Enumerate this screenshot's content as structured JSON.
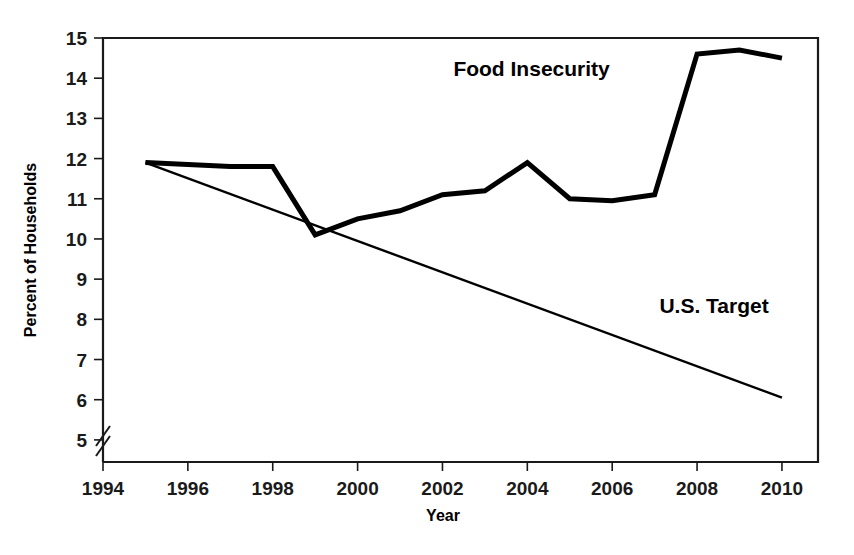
{
  "chart_data": {
    "type": "line",
    "title": "",
    "xlabel": "Year",
    "ylabel": "Percent of Households",
    "xlim": [
      1994,
      2010.85
    ],
    "ylim": [
      4.45,
      15
    ],
    "grid": false,
    "legend_position": "inline-annotations",
    "x_ticks": [
      1994,
      1996,
      1998,
      2000,
      2002,
      2004,
      2006,
      2008,
      2010
    ],
    "x_tick_labels": [
      "1994",
      "1996",
      "1998",
      "2000",
      "2002",
      "2004",
      "2006",
      "2008",
      "2010"
    ],
    "x_minor_ticks": [
      1995,
      1997,
      1999,
      2001,
      2003,
      2005,
      2007,
      2009
    ],
    "y_ticks": [
      5,
      6,
      7,
      8,
      9,
      10,
      11,
      12,
      13,
      14,
      15
    ],
    "y_tick_labels": [
      "5",
      "6",
      "7",
      "8",
      "9",
      "10",
      "11",
      "12",
      "13",
      "14",
      "15"
    ],
    "y_axis_break": true,
    "y_axis_break_note": "axis break between 0 and 5",
    "series": [
      {
        "name": "Food Insecurity",
        "label": "Food Insecurity",
        "stroke_width": 5,
        "x": [
          1995,
          1996,
          1997,
          1998,
          1999,
          2000,
          2001,
          2002,
          2003,
          2004,
          2005,
          2006,
          2007,
          2008,
          2009,
          2010
        ],
        "values": [
          11.9,
          11.85,
          11.8,
          11.8,
          10.1,
          10.5,
          10.7,
          11.1,
          11.2,
          11.9,
          11.0,
          10.95,
          11.1,
          14.6,
          14.7,
          14.5
        ]
      },
      {
        "name": "U.S. Target",
        "label": "U.S. Target",
        "stroke_width": 2.4,
        "x": [
          1995,
          2010
        ],
        "values": [
          11.9,
          6.05
        ]
      }
    ],
    "annotations": [
      {
        "text": "Food Insecurity",
        "x": 2004.1,
        "y": 14.05
      },
      {
        "text": "U.S. Target",
        "x": 2008.4,
        "y": 8.15
      }
    ]
  }
}
